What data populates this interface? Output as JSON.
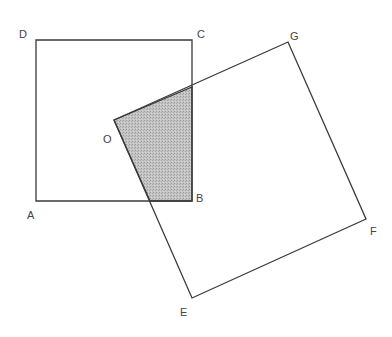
{
  "figure": {
    "type": "geometry",
    "colors": {
      "stroke": "#3a3a3a",
      "shade": "#bdbdbd",
      "label": "#444444",
      "background": "#ffffff"
    },
    "labels": {
      "A": "A",
      "B": "B",
      "C": "C",
      "D": "D",
      "O": "O",
      "E": "E",
      "F": "F",
      "G": "G"
    },
    "square_ABCD": {
      "vertices": [
        "A",
        "B",
        "C",
        "D"
      ],
      "coords": {
        "A": [
          36,
          201
        ],
        "B": [
          192,
          201
        ],
        "C": [
          192,
          40
        ],
        "D": [
          36,
          40
        ]
      }
    },
    "square_OEFG": {
      "vertices": [
        "O",
        "E",
        "F",
        "G"
      ],
      "coords": {
        "O": [
          114,
          120
        ],
        "E": [
          192,
          298
        ],
        "F": [
          366,
          219
        ],
        "G": [
          288,
          42
        ]
      }
    },
    "shaded_region": {
      "vertices": [
        "O",
        "OG∩BC",
        "B",
        "OE∩AB"
      ],
      "coords": [
        [
          114,
          120
        ],
        [
          192,
          87
        ],
        [
          192,
          201
        ],
        [
          150,
          201
        ]
      ]
    }
  }
}
